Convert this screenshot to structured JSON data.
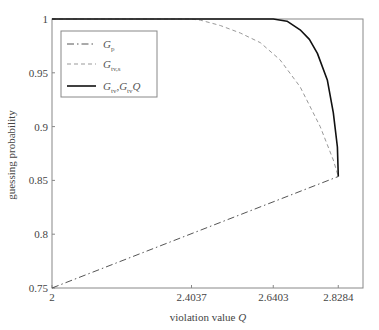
{
  "chart_data": {
    "type": "line",
    "title": "",
    "xlabel": "violation value Q",
    "xlabel_text": "violation value ",
    "xlabel_var": "Q",
    "ylabel": "guessing probability",
    "xlim": [
      2,
      2.9
    ],
    "ylim": [
      0.75,
      1.0
    ],
    "grid": false,
    "legend_position": "upper left",
    "x_ticks": [
      2,
      2.4037,
      2.6403,
      2.8284
    ],
    "x_tick_labels": [
      "2",
      "2.4037",
      "2.6403",
      "2.8284"
    ],
    "y_ticks": [
      0.75,
      0.8,
      0.85,
      0.9,
      0.95,
      1
    ],
    "y_tick_labels": [
      "0.75",
      "0.8",
      "0.85",
      "0.9",
      "0.95",
      "1"
    ],
    "series": [
      {
        "name": "G_p",
        "legend_main": "G",
        "legend_sub": "p",
        "legend_tail": "",
        "style": "dashdot",
        "color": "#555555",
        "x": [
          2,
          2.8284
        ],
        "y": [
          0.75,
          0.8536
        ]
      },
      {
        "name": "G_tv,s",
        "legend_main": "G",
        "legend_sub": "tv,s",
        "legend_tail": "",
        "style": "dashed",
        "color": "#999999",
        "x": [
          2,
          2.4,
          2.429,
          2.487,
          2.545,
          2.603,
          2.66,
          2.718,
          2.776,
          2.814,
          2.8284
        ],
        "y": [
          1.0,
          1.0,
          0.999,
          0.994,
          0.987,
          0.978,
          0.962,
          0.937,
          0.9,
          0.869,
          0.8536
        ]
      },
      {
        "name": "G_tv,G_tv Q",
        "legend_main": "G",
        "legend_sub": "tv",
        "legend_tail": ",G",
        "legend_sub2": "tv",
        "legend_tail2": "Q",
        "style": "solid",
        "color": "#111111",
        "x": [
          2,
          2.6403,
          2.68,
          2.718,
          2.745,
          2.768,
          2.797,
          2.814,
          2.826,
          2.8284
        ],
        "y": [
          1.0,
          1.0,
          0.998,
          0.99,
          0.981,
          0.968,
          0.943,
          0.913,
          0.881,
          0.8536
        ]
      }
    ]
  }
}
